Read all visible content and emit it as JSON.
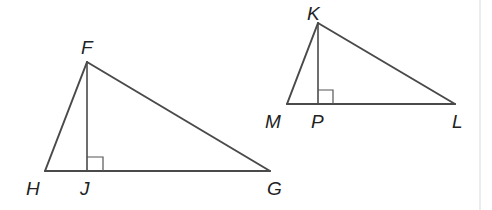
{
  "diagram": {
    "type": "geometry",
    "colors": {
      "line": "#4a4a4a",
      "label": "#222222",
      "background": "#ffffff"
    },
    "triangles": [
      {
        "name": "FHG",
        "vertices": {
          "F": {
            "label": "F",
            "x": 87,
            "y": 62
          },
          "H": {
            "label": "H",
            "x": 45,
            "y": 171
          },
          "G": {
            "label": "G",
            "x": 270,
            "y": 171
          }
        },
        "altitude": {
          "from": "F",
          "foot": "J",
          "foot_label": "J",
          "foot_x": 87,
          "foot_y": 171
        },
        "right_angle_at": "J"
      },
      {
        "name": "KML",
        "vertices": {
          "K": {
            "label": "K",
            "x": 318,
            "y": 23
          },
          "M": {
            "label": "M",
            "x": 287,
            "y": 104
          },
          "L": {
            "label": "L",
            "x": 455,
            "y": 104
          }
        },
        "altitude": {
          "from": "K",
          "foot": "P",
          "foot_label": "P",
          "foot_x": 318,
          "foot_y": 104
        },
        "right_angle_at": "P"
      }
    ]
  }
}
